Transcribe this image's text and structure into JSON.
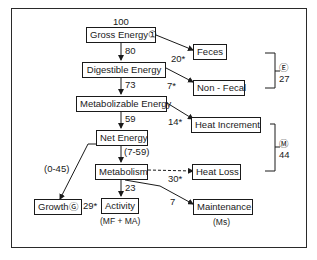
{
  "diagram": {
    "nodes": {
      "gross_energy": "Gross Energy①",
      "digestible_energy": "Digestible Energy",
      "metabolizable_energy": "Metabolizable Energy",
      "net_energy": "Net Energy",
      "metabolism": "Metabolism",
      "growth": "GrowthⒼ",
      "activity": "Activity",
      "maintenance": "Maintenance",
      "feces": "Feces",
      "non_fecal": "Non - Fecal",
      "heat_increment": "Heat Increment",
      "heat_loss": "Heat Loss"
    },
    "values": {
      "gross": "100",
      "gross_to_digestible": "80",
      "digestible_to_metabolizable": "73",
      "metabolizable_to_net": "59",
      "net_to_metabolism": "(7-59)",
      "net_to_growth": "(0-45)",
      "metabolism_to_activity": "23",
      "metabolism_to_maintenance": "7",
      "to_feces": "20*",
      "to_non_fecal": "7*",
      "to_heat_increment": "14*",
      "to_heat_loss": "30*",
      "to_growth": "29*"
    },
    "sublabels": {
      "activity": "(MF + MA)",
      "maintenance": "(Ms)"
    },
    "brackets": {
      "excretion_symbol": "Ⓔ",
      "excretion_value": "27",
      "metabolism_symbol": "Ⓜ",
      "metabolism_value": "44"
    }
  }
}
